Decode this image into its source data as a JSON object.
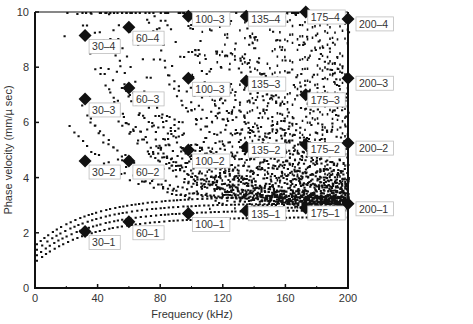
{
  "chart_data": {
    "type": "scatter",
    "title": "",
    "xlabel": "Frequency (kHz)",
    "ylabel": "Phase velocity (mm/µ sec)",
    "xlim": [
      0,
      200
    ],
    "ylim": [
      0,
      10
    ],
    "xticks": [
      0,
      40,
      80,
      120,
      160,
      200
    ],
    "yticks": [
      0,
      2,
      4,
      6,
      8,
      10
    ],
    "grid": false,
    "legend": null,
    "series": [
      {
        "name": "dispersion curves (dense dots)",
        "marker": "square-dot",
        "description": "Many guided-wave dispersion branches; branches start near 1-1.6 mm/us at low frequency and rise, band structure converging toward ~2.7-3 mm/us, higher branches fan out up to 10 mm/us; density increases with frequency, becoming nearly solid above ~100 kHz."
      },
      {
        "name": "selected modes",
        "marker": "diamond",
        "points": [
          {
            "label": "30–1",
            "x": 32,
            "y": 2.05
          },
          {
            "label": "30–2",
            "x": 32,
            "y": 4.6
          },
          {
            "label": "30–3",
            "x": 32,
            "y": 6.85
          },
          {
            "label": "30–4",
            "x": 32,
            "y": 9.15
          },
          {
            "label": "60–1",
            "x": 60,
            "y": 2.4
          },
          {
            "label": "60–2",
            "x": 60,
            "y": 4.6
          },
          {
            "label": "60–3",
            "x": 60,
            "y": 7.25
          },
          {
            "label": "60–4",
            "x": 60,
            "y": 9.45
          },
          {
            "label": "100–1",
            "x": 98,
            "y": 2.7
          },
          {
            "label": "100–2",
            "x": 98,
            "y": 5.0
          },
          {
            "label": "100–3",
            "x": 98,
            "y": 7.6
          },
          {
            "label": "100–3",
            "x": 98,
            "y": 9.85
          },
          {
            "label": "135–1",
            "x": 135,
            "y": 2.8
          },
          {
            "label": "135–2",
            "x": 135,
            "y": 5.1
          },
          {
            "label": "135–3",
            "x": 135,
            "y": 7.5
          },
          {
            "label": "135–4",
            "x": 135,
            "y": 9.85
          },
          {
            "label": "175–1",
            "x": 173,
            "y": 2.9
          },
          {
            "label": "175–2",
            "x": 173,
            "y": 5.2
          },
          {
            "label": "175–3",
            "x": 173,
            "y": 7.0
          },
          {
            "label": "175–4",
            "x": 173,
            "y": 10.0
          },
          {
            "label": "200–1",
            "x": 200,
            "y": 3.05
          },
          {
            "label": "200–2",
            "x": 200,
            "y": 5.25
          },
          {
            "label": "200–3",
            "x": 200,
            "y": 7.6
          },
          {
            "label": "200–4",
            "x": 200,
            "y": 9.75
          }
        ]
      }
    ],
    "label_offsets": [
      [
        4,
        14
      ],
      [
        4,
        14
      ],
      [
        4,
        14
      ],
      [
        4,
        14
      ],
      [
        4,
        14
      ],
      [
        4,
        14
      ],
      [
        4,
        14
      ],
      [
        4,
        14
      ],
      [
        4,
        14
      ],
      [
        4,
        14
      ],
      [
        4,
        14
      ],
      [
        4,
        6
      ],
      [
        2,
        6
      ],
      [
        2,
        6
      ],
      [
        2,
        6
      ],
      [
        2,
        6
      ],
      [
        2,
        8
      ],
      [
        2,
        8
      ],
      [
        2,
        8
      ],
      [
        2,
        8
      ],
      [
        8,
        8
      ],
      [
        8,
        8
      ],
      [
        8,
        8
      ],
      [
        8,
        8
      ]
    ],
    "colors": {
      "data": "#111111",
      "axis": "#111111",
      "label_box_border": "#bdbdbd",
      "text": "#333333"
    }
  }
}
